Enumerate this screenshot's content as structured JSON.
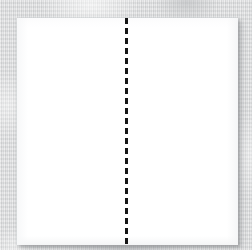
{
  "scene": {
    "width": 252,
    "height": 250,
    "description": "Blank white square sheet of paper on a light gray woven fabric surface, with a single vertical black dashed fold line running top to bottom through the middle of the sheet.",
    "background": {
      "name": "fabric-surface",
      "color": "#d9dadb",
      "texture": "vertical-weave-stripes"
    }
  },
  "paper": {
    "label": "white-paper-sheet",
    "fill_color": "#ffffff",
    "edge_color": "#cdcfd2",
    "shadow_color": "#787a7d",
    "left": 17,
    "top": 18,
    "width": 221,
    "height": 227
  },
  "fold_line": {
    "label": "vertical-dashed-fold-line",
    "color": "#141414",
    "orientation": "vertical",
    "style": "dashed",
    "thickness_px": 3,
    "dash_length_px": 6,
    "gap_length_px": 4,
    "x_position_px": 125,
    "start_y_px": 18,
    "end_y_px": 245,
    "spans_full_height": true
  },
  "annotations": {
    "text_content": "",
    "visible_labels": []
  }
}
